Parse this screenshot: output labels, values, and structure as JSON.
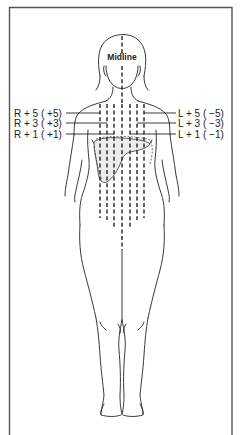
{
  "diagram": {
    "midline_label": "Midline",
    "right_labels": [
      {
        "text": "R + 5 ( +5)",
        "level": 5
      },
      {
        "text": "R + 3 ( +3)",
        "level": 3
      },
      {
        "text": "R + 1 ( +1)",
        "level": 1
      }
    ],
    "left_labels": [
      {
        "text": "L + 5 ( −5)",
        "level": 5
      },
      {
        "text": "L + 3 ( −3)",
        "level": 3
      },
      {
        "text": "L + 1 ( −1)",
        "level": 1
      }
    ],
    "figure": "female-body-front-view",
    "guide_lines": [
      "R+5",
      "R+3",
      "R+1",
      "Midline",
      "L+1",
      "L+3",
      "L+5"
    ],
    "highlighted_organ": "liver"
  }
}
